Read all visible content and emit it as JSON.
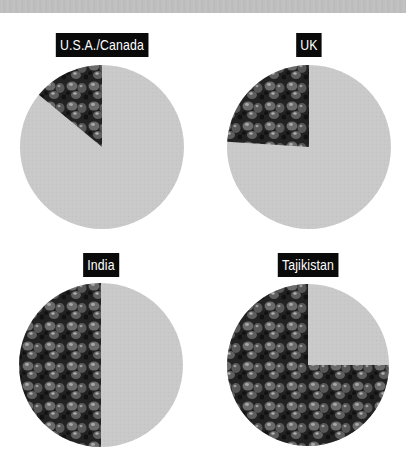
{
  "chart_data": {
    "type": "pie",
    "title": "",
    "series_name": "share",
    "charts": [
      {
        "label": "U.S.A./Canada",
        "highlighted_fraction": 0.14
      },
      {
        "label": "UK",
        "highlighted_fraction": 0.24
      },
      {
        "label": "India",
        "highlighted_fraction": 0.5
      },
      {
        "label": "Tajikistan",
        "highlighted_fraction": 0.75
      }
    ],
    "colors": {
      "remainder": "#c8c8c8",
      "highlight_base": "#2a2a2a",
      "label_bg": "#0a0a0a",
      "label_text": "#ffffff"
    }
  }
}
